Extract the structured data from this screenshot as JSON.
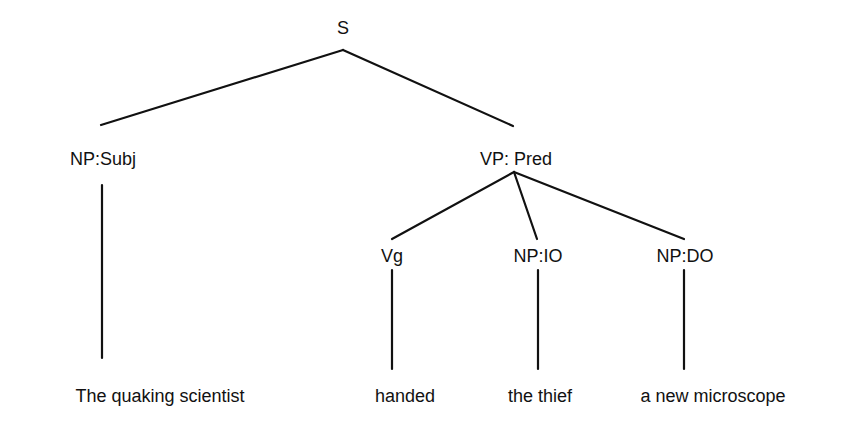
{
  "tree": {
    "root": {
      "label": "S"
    },
    "subject": {
      "label": "NP:Subj",
      "leaf": "The quaking scientist"
    },
    "predicate": {
      "label": "VP: Pred"
    },
    "verb": {
      "label": "Vg",
      "leaf": "handed"
    },
    "indirect_object": {
      "label": "NP:IO",
      "leaf": "the thief"
    },
    "direct_object": {
      "label": "NP:DO",
      "leaf": "a new microscope"
    }
  },
  "colors": {
    "line": "#111111",
    "text": "#111111",
    "background": "#ffffff"
  }
}
